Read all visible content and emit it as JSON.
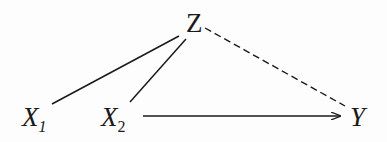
{
  "diagram": {
    "nodes": [
      {
        "id": "Z",
        "label": "Z",
        "subscript": "",
        "x": 195,
        "y": 25
      },
      {
        "id": "X1",
        "label": "X",
        "subscript": "1",
        "x": 35,
        "y": 118
      },
      {
        "id": "X2",
        "label": "X",
        "subscript": "2",
        "x": 112,
        "y": 118
      },
      {
        "id": "Y",
        "label": "Y",
        "subscript": "",
        "x": 358,
        "y": 118
      }
    ],
    "edges": [
      {
        "from": "X1",
        "to": "Z",
        "style": "solid",
        "directed": false
      },
      {
        "from": "X2",
        "to": "Z",
        "style": "solid",
        "directed": false
      },
      {
        "from": "Z",
        "to": "Y",
        "style": "dashed",
        "directed": false
      },
      {
        "from": "X2",
        "to": "Y",
        "style": "solid",
        "directed": true
      }
    ],
    "colors": {
      "ink": "#1a1a1a",
      "background": "#fdfdfd"
    }
  }
}
